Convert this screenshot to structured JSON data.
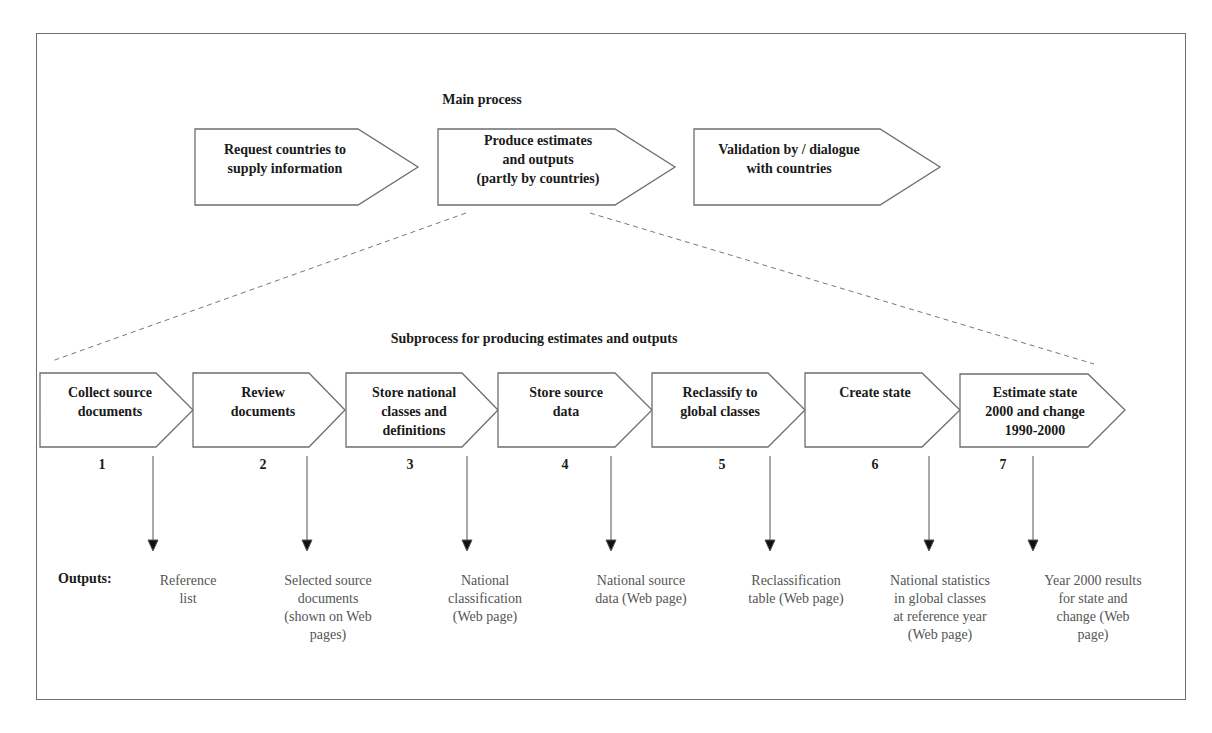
{
  "main": {
    "title": "Main process",
    "steps": [
      {
        "label": "Request countries to\nsupply information"
      },
      {
        "label": "Produce estimates\nand outputs\n(partly by countries)"
      },
      {
        "label": "Validation by / dialogue\nwith countries"
      }
    ]
  },
  "sub": {
    "title": "Subprocess for producing estimates and outputs",
    "steps": [
      {
        "number": "1",
        "label": "Collect source\ndocuments",
        "output": "Reference\nlist"
      },
      {
        "number": "2",
        "label": "Review\ndocuments",
        "output": "Selected source\ndocuments\n(shown on Web\npages)"
      },
      {
        "number": "3",
        "label": "Store national\nclasses and\ndefinitions",
        "output": "National\nclassification\n(Web page)"
      },
      {
        "number": "4",
        "label": "Store source\ndata",
        "output": "National source\ndata (Web page)"
      },
      {
        "number": "5",
        "label": "Reclassify to\nglobal classes",
        "output": "Reclassification\ntable (Web page)"
      },
      {
        "number": "6",
        "label": "Create state",
        "output": "National statistics\nin global classes\nat reference year\n(Web page)"
      },
      {
        "number": "7",
        "label": "Estimate state\n2000 and change\n1990-2000",
        "output": "Year 2000 results\nfor state and\nchange (Web\npage)"
      }
    ]
  },
  "outputs_label": "Outputs:",
  "colors": {
    "stroke": "#6e6e6e",
    "text": "#1a1a1a",
    "output_text": "#555555"
  }
}
